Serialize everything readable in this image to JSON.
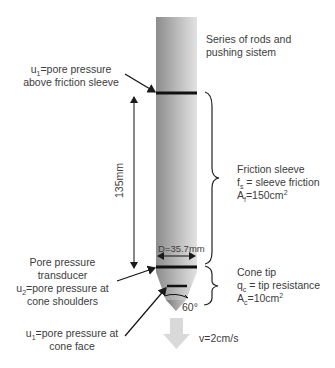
{
  "diagram": {
    "rod_label": [
      "Series of rods and",
      "pushing sistem"
    ],
    "u1_sleeve": {
      "symbol": "u",
      "sub": "1",
      "line1": "=pore pressure",
      "line2": "above friction sleeve"
    },
    "dimension_length": "135mm",
    "diameter": "D=35.7mm",
    "friction_sleeve": {
      "title": "Friction sleeve",
      "fs_symbol": "f",
      "fs_sub": "s",
      "fs_text": " = sleeve friction",
      "area_symbol": "A",
      "area_sub": "f",
      "area_value": "=150cm",
      "area_sup": "2"
    },
    "transducer": {
      "line1": "Pore pressure",
      "line2": "transducer",
      "u2_symbol": "u",
      "u2_sub": "2",
      "u2_text": "=pore pressure at",
      "line4": "cone shoulders"
    },
    "cone_tip": {
      "title": "Cone tip",
      "qc_symbol": "q",
      "qc_sub": "c",
      "qc_text": " = tip resistance",
      "area_symbol": "A",
      "area_sub": "c",
      "area_value": "=10cm",
      "area_sup": "2"
    },
    "u1_face": {
      "symbol": "u",
      "sub": "1",
      "line1": "=pore pressure at",
      "line2": "cone face"
    },
    "angle": "60°",
    "velocity": "v=2cm/s",
    "colors": {
      "rod_dark": "#8a8a8a",
      "rod_light": "#dedede",
      "line": "#1a1a1a",
      "arrow": "#d9d9d9"
    }
  }
}
